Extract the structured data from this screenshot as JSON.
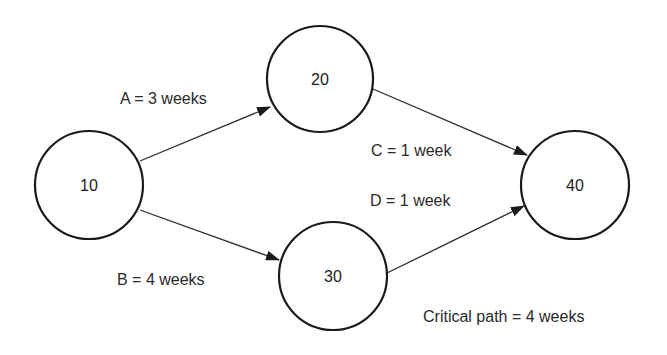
{
  "diagram": {
    "type": "activity-on-arrow network",
    "nodes": [
      {
        "id": "10",
        "label": "10",
        "cx": 89,
        "cy": 185,
        "r": 54
      },
      {
        "id": "20",
        "label": "20",
        "cx": 320,
        "cy": 79,
        "r": 53
      },
      {
        "id": "30",
        "label": "30",
        "cx": 333,
        "cy": 276,
        "r": 54
      },
      {
        "id": "40",
        "label": "40",
        "cx": 575,
        "cy": 185,
        "r": 54
      }
    ],
    "edges": [
      {
        "id": "A",
        "from": "10",
        "to": "20",
        "label": "A = 3 weeks"
      },
      {
        "id": "B",
        "from": "10",
        "to": "30",
        "label": "B = 4 weeks"
      },
      {
        "id": "C",
        "from": "20",
        "to": "40",
        "label": "C = 1 week"
      },
      {
        "id": "D",
        "from": "30",
        "to": "40",
        "label": "D = 1 week"
      }
    ],
    "note": "Critical path = 4 weeks"
  }
}
